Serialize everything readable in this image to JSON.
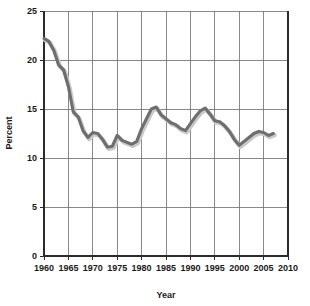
{
  "chart_data": {
    "type": "line",
    "title": "",
    "xlabel": "Year",
    "ylabel": "Percent",
    "xlim": [
      1960,
      2010
    ],
    "ylim": [
      0,
      25
    ],
    "xticks": [
      1960,
      1965,
      1970,
      1975,
      1980,
      1985,
      1990,
      1995,
      2000,
      2005,
      2010
    ],
    "yticks": [
      0,
      5,
      10,
      15,
      20,
      25
    ],
    "grid": true,
    "legend": "none",
    "series": [
      {
        "name": "Percent",
        "color": "#6e6e6e",
        "x": [
          1960,
          1961,
          1962,
          1963,
          1964,
          1965,
          1966,
          1967,
          1968,
          1969,
          1970,
          1971,
          1972,
          1973,
          1974,
          1975,
          1976,
          1977,
          1978,
          1979,
          1980,
          1981,
          1982,
          1983,
          1984,
          1985,
          1986,
          1987,
          1988,
          1989,
          1990,
          1991,
          1992,
          1993,
          1994,
          1995,
          1996,
          1997,
          1998,
          1999,
          2000,
          2001,
          2002,
          2003,
          2004,
          2005,
          2006,
          2007
        ],
        "values": [
          22.2,
          21.9,
          21.0,
          19.5,
          19.0,
          17.3,
          14.7,
          14.2,
          12.8,
          12.1,
          12.6,
          12.5,
          11.9,
          11.1,
          11.2,
          12.3,
          11.8,
          11.6,
          11.4,
          11.7,
          13.0,
          14.0,
          15.0,
          15.2,
          14.4,
          14.0,
          13.6,
          13.4,
          13.0,
          12.8,
          13.5,
          14.2,
          14.8,
          15.1,
          14.5,
          13.8,
          13.7,
          13.3,
          12.7,
          11.9,
          11.3,
          11.7,
          12.1,
          12.5,
          12.7,
          12.6,
          12.3,
          12.5
        ]
      }
    ]
  },
  "axes": {
    "ylabel": "Percent",
    "xlabel": "Year",
    "ytick_labels": [
      "0",
      "5",
      "10",
      "15",
      "20",
      "25"
    ],
    "xtick_labels": [
      "1960",
      "1965",
      "1970",
      "1975",
      "1980",
      "1985",
      "1990",
      "1995",
      "2000",
      "2005",
      "2010"
    ]
  },
  "colors": {
    "line": "#6e6e6e",
    "line_shadow": "#c9c9c9",
    "grid": "#6b6b6b",
    "axis": "#2b2b2b",
    "text": "#1a1a1a",
    "background": "#ffffff"
  }
}
